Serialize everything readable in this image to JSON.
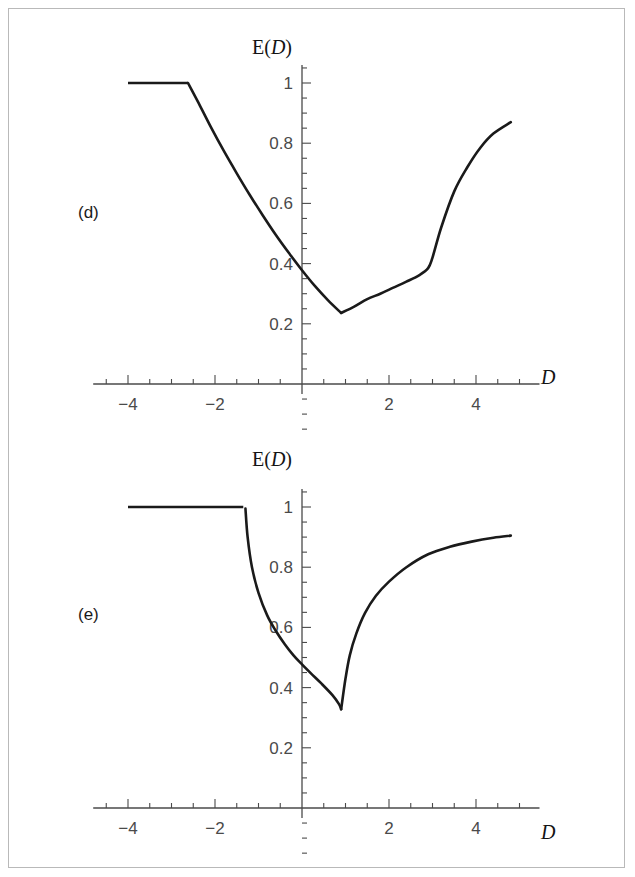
{
  "figure": {
    "background_color": "#ffffff",
    "border_color": "#b9b9b9",
    "curve_color": "#1a1a1a",
    "axis_color": "#4a4a4a",
    "tick_label_color": "#4a4a4a"
  },
  "panels": [
    {
      "label": "(d)",
      "ylabel_prefix": "E(",
      "ylabel_var": "D",
      "ylabel_suffix": ")",
      "xlabel": "D"
    },
    {
      "label": "(e)",
      "ylabel_prefix": "E(",
      "ylabel_var": "D",
      "ylabel_suffix": ")",
      "xlabel": "D"
    }
  ],
  "chart_data": [
    {
      "type": "line",
      "panel": "(d)",
      "title": "",
      "xlabel": "D",
      "ylabel": "E(D)",
      "xlim": [
        -4.8,
        5.0
      ],
      "ylim": [
        0.0,
        1.06
      ],
      "xticks": [
        -4,
        -2,
        2,
        4
      ],
      "xtick_labels": [
        "-4",
        "-2",
        "2",
        "4"
      ],
      "yticks": [
        0.2,
        0.4,
        0.6,
        0.8,
        1
      ],
      "ytick_labels": [
        "0.2",
        "0.4",
        "0.6",
        "0.8",
        "1"
      ],
      "x_minor_interval": 0.5,
      "y_minor_interval": 0.05,
      "grid": false,
      "legend": false,
      "series": [
        {
          "name": "E(D)",
          "x": [
            -4.0,
            -3.5,
            -3.0,
            -2.62,
            -2.4,
            -2.1,
            -1.8,
            -1.5,
            -1.2,
            -0.9,
            -0.6,
            -0.3,
            0.0,
            0.3,
            0.6,
            0.9,
            1.2,
            1.5,
            1.8,
            2.1,
            2.4,
            2.7,
            2.9,
            3.0,
            3.2,
            3.5,
            3.8,
            4.1,
            4.4,
            4.8
          ],
          "y": [
            1.0,
            1.0,
            1.0,
            1.0,
            0.94,
            0.855,
            0.775,
            0.7,
            0.628,
            0.56,
            0.495,
            0.435,
            0.378,
            0.325,
            0.278,
            0.236,
            0.257,
            0.282,
            0.3,
            0.32,
            0.34,
            0.362,
            0.385,
            0.42,
            0.52,
            0.64,
            0.72,
            0.785,
            0.832,
            0.87
          ]
        }
      ],
      "features": {
        "plateau_end_x": -2.62,
        "plateau_value": 1.0,
        "minimum_x": 0.9,
        "minimum_y": 0.236,
        "kink_x": 2.9,
        "kink_y": 0.385,
        "right_end_x": 4.8,
        "right_end_y": 0.87
      }
    },
    {
      "type": "line",
      "panel": "(e)",
      "title": "",
      "xlabel": "D",
      "ylabel": "E(D)",
      "xlim": [
        -4.8,
        5.0
      ],
      "ylim": [
        0.0,
        1.06
      ],
      "xticks": [
        -4,
        -2,
        2,
        4
      ],
      "xtick_labels": [
        "-4",
        "-2",
        "2",
        "4"
      ],
      "yticks": [
        0.2,
        0.4,
        0.6,
        0.8,
        1
      ],
      "ytick_labels": [
        "0.2",
        "0.4",
        "0.6",
        "0.8",
        "1"
      ],
      "x_minor_interval": 0.5,
      "y_minor_interval": 0.05,
      "grid": false,
      "legend": false,
      "series": [
        {
          "name": "E(D)",
          "x": [
            -4.0,
            -3.5,
            -3.0,
            -2.5,
            -2.0,
            -1.6,
            -1.35,
            -1.3,
            -1.25,
            -1.15,
            -1.0,
            -0.8,
            -0.6,
            -0.4,
            -0.2,
            0.0,
            0.2,
            0.45,
            0.7,
            0.85,
            0.9,
            1.0,
            1.1,
            1.25,
            1.45,
            1.7,
            2.0,
            2.4,
            2.9,
            3.4,
            3.9,
            4.4,
            4.8
          ],
          "y": [
            1.0,
            1.0,
            1.0,
            1.0,
            1.0,
            1.0,
            1.0,
            0.995,
            0.9,
            0.8,
            0.715,
            0.64,
            0.588,
            0.545,
            0.508,
            0.477,
            0.448,
            0.413,
            0.375,
            0.345,
            0.328,
            0.43,
            0.508,
            0.58,
            0.648,
            0.705,
            0.752,
            0.8,
            0.843,
            0.868,
            0.885,
            0.898,
            0.905
          ]
        }
      ],
      "features": {
        "plateau_end_x": -1.32,
        "plateau_value": 1.0,
        "minimum_x": 0.9,
        "minimum_y": 0.328,
        "right_end_x": 4.8,
        "right_end_y": 0.905
      }
    }
  ]
}
